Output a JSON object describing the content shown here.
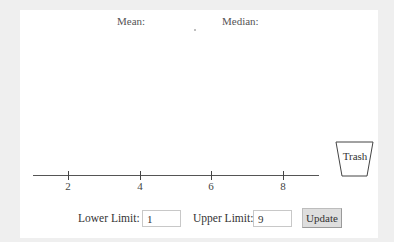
{
  "stats": {
    "mean_label": "Mean:",
    "median_label": "Median:"
  },
  "number_line": {
    "min": 1,
    "max": 9,
    "ticks": [
      {
        "value": 2,
        "label": "2"
      },
      {
        "value": 4,
        "label": "4"
      },
      {
        "value": 6,
        "label": "6"
      },
      {
        "value": 8,
        "label": "8"
      }
    ]
  },
  "trash": {
    "label": "Trash"
  },
  "controls": {
    "lower_limit_label": "Lower Limit:",
    "lower_limit_value": "1",
    "upper_limit_label": "Upper Limit:",
    "upper_limit_value": "9",
    "update_label": "Update"
  }
}
